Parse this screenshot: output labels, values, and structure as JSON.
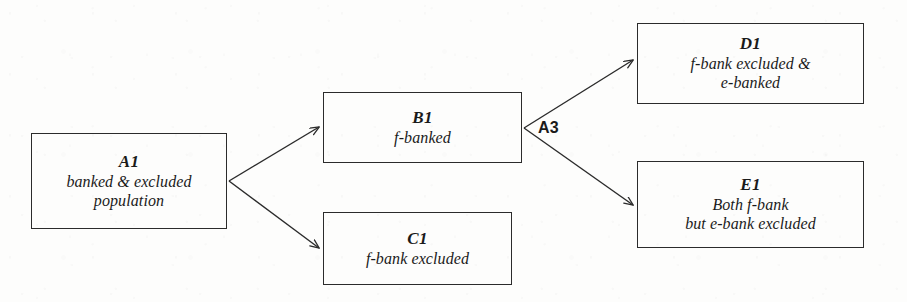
{
  "diagram": {
    "background_color": "#fdfdfc",
    "line_color": "#2b2b2b",
    "nodes": [
      {
        "key": "a1",
        "id": "A1",
        "description": "banked & excluded\npopulation"
      },
      {
        "key": "b1",
        "id": "B1",
        "description": "f-banked"
      },
      {
        "key": "c1",
        "id": "C1",
        "description": "f-bank excluded"
      },
      {
        "key": "d1",
        "id": "D1",
        "description": "f-bank excluded &\ne-banked"
      },
      {
        "key": "e1",
        "id": "E1",
        "description": "Both f-bank\nbut e-bank excluded"
      }
    ],
    "edge_labels": [
      {
        "key": "a3",
        "text": "A3"
      }
    ]
  }
}
